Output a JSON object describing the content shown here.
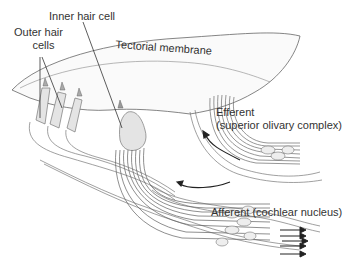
{
  "diagram": {
    "labels": {
      "inner_hair_cell": "Inner hair cell",
      "outer_hair_cells_line1": "Outer hair",
      "outer_hair_cells_line2": "cells",
      "tectorial_membrane": "Tectorial membrane",
      "efferent_line1": "Efferent",
      "efferent_line2": "(superior olivary complex)",
      "afferent": "Afferent (cochlear nucleus)"
    },
    "colors": {
      "line": "#555555",
      "cell_fill": "#e4e4e4",
      "fiber": "#6a6a6a",
      "arrow": "#222222",
      "text": "#333333"
    }
  }
}
